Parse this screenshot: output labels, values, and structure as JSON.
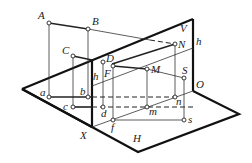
{
  "figure": {
    "planes": {
      "V": "V",
      "H": "H"
    },
    "axis": {
      "start": "X",
      "end": "O"
    },
    "labels": {
      "A": "A",
      "B": "B",
      "C": "C",
      "D": "D",
      "F": "F",
      "M": "M",
      "N": "N",
      "S": "S",
      "a": "a",
      "b": "b",
      "c": "c",
      "d": "d",
      "f": "f",
      "m": "m",
      "n": "n",
      "s": "s",
      "h_left": "h",
      "h_right": "h",
      "V": "V",
      "H": "H",
      "X": "X",
      "O": "O"
    },
    "colors": {
      "line": "#111111",
      "background": "#ffffff"
    }
  }
}
